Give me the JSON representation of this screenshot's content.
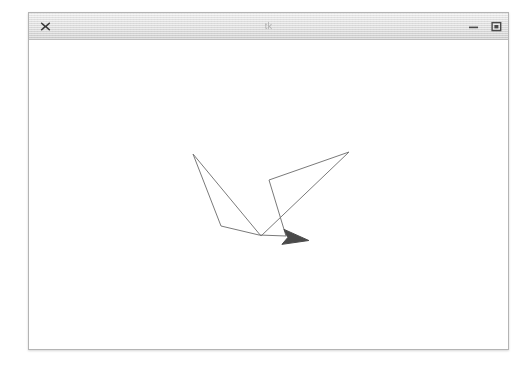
{
  "desktop": {
    "background_color": "#ffffff"
  },
  "window": {
    "title": "tk",
    "title_bar_color": "#e4e4e4",
    "border_color": "#b4b4b4",
    "client_background": "#ffffff",
    "close_label": "×",
    "minimize_label": "–",
    "maximize_label": "❑",
    "controls": [
      {
        "name": "close",
        "label": "×"
      },
      {
        "name": "minimize",
        "label": "–"
      },
      {
        "name": "maximize",
        "label": "❑"
      }
    ]
  },
  "canvas": {
    "label": "turtle-graphics-canvas",
    "background": "#ffffff",
    "stroke_color": "#7a7a7a",
    "stroke_width": 1,
    "turtle": {
      "color": "#4a4a4a",
      "x": 262,
      "y": 198,
      "heading_degrees": 8,
      "size": 18,
      "shape": "arrow"
    },
    "path_points": [
      {
        "x": 164,
        "y": 114
      },
      {
        "x": 192,
        "y": 186
      },
      {
        "x": 230,
        "y": 195
      },
      {
        "x": 257,
        "y": 196
      },
      {
        "x": 240,
        "y": 140
      },
      {
        "x": 320,
        "y": 112
      },
      {
        "x": 232,
        "y": 196
      },
      {
        "x": 164,
        "y": 114
      }
    ],
    "path_description": "closed polyline forming a bird / wing outline with crossing strokes"
  }
}
